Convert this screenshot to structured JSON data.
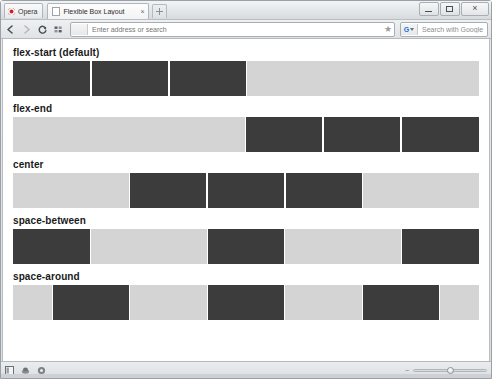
{
  "browser": {
    "name": "Opera",
    "menu_button_label": "Opera",
    "tab": {
      "title": "Flexible Box Layout",
      "close_label": "×",
      "favicon_icon": "page-icon"
    },
    "new_tab_label": "+",
    "window_controls": {
      "minimize_label": "Minimize",
      "maximize_label": "Maximize",
      "close_label": "×"
    },
    "toolbar": {
      "back_label": "Back",
      "forward_label": "Forward",
      "reload_label": "Reload",
      "speeddial_label": "Speed Dial",
      "address_value": "",
      "address_placeholder": "Enter address or search",
      "bookmark_star": "★",
      "search_engine": "G",
      "search_value": "",
      "search_placeholder": "Search with Google"
    },
    "statusbar": {
      "panels_label": "Panels",
      "unite_label": "Unite",
      "turbo_label": "Opera Turbo",
      "zoom_out_label": "−",
      "zoom_level": "100%"
    }
  },
  "page": {
    "container_color": "#d4d4d4",
    "item_color": "#3c3c3c",
    "sections": [
      {
        "title": "flex-start (default)",
        "justify": "js-start",
        "items": 3
      },
      {
        "title": "flex-end",
        "justify": "js-end",
        "items": 3
      },
      {
        "title": "center",
        "justify": "js-center",
        "items": 3
      },
      {
        "title": "space-between",
        "justify": "js-between",
        "items": 3
      },
      {
        "title": "space-around",
        "justify": "js-around",
        "items": 3
      }
    ]
  }
}
